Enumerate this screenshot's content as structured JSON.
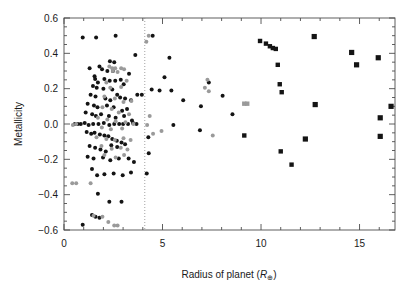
{
  "chart_data": {
    "type": "scatter",
    "title": "",
    "xlabel": "Radius of planet (R⊕)",
    "ylabel": "Metallicity",
    "xlim": [
      0,
      16.8
    ],
    "ylim": [
      -0.6,
      0.6
    ],
    "xticks": [
      0,
      5,
      10,
      15
    ],
    "xtick_labels": [
      "0",
      "5",
      "10",
      "15"
    ],
    "yticks": [
      -0.6,
      -0.4,
      -0.2,
      0.0,
      0.2,
      0.4,
      0.6
    ],
    "ytick_labels": [
      "-0.6",
      "-0.4",
      "-0.2",
      "0.0",
      "0.2",
      "0.4",
      "0.6"
    ],
    "xminor_step": 1,
    "yminor_step": 0.05,
    "grid": false,
    "legend": "none",
    "annotations": [
      {
        "type": "vline",
        "x": 4.1,
        "style": "dotted",
        "color": "#8c8c8c",
        "label": "radius divider at 4 Earth radii"
      }
    ],
    "series": [
      {
        "name": "dark-markers",
        "color": "#141414",
        "marker": "circle",
        "points": [
          [
            0.95,
            0.49
          ],
          [
            1.63,
            0.49
          ],
          [
            2.62,
            0.5
          ],
          [
            2.33,
            0.355
          ],
          [
            2.55,
            0.35
          ],
          [
            1.3,
            0.315
          ],
          [
            1.8,
            0.325
          ],
          [
            1.93,
            0.31
          ],
          [
            2.2,
            0.3
          ],
          [
            2.48,
            0.3
          ],
          [
            3.62,
            0.39
          ],
          [
            4.5,
            0.5
          ],
          [
            1.55,
            0.27
          ],
          [
            1.58,
            0.255
          ],
          [
            1.72,
            0.235
          ],
          [
            2.05,
            0.255
          ],
          [
            2.32,
            0.245
          ],
          [
            2.6,
            0.245
          ],
          [
            2.88,
            0.25
          ],
          [
            3.03,
            0.225
          ],
          [
            3.3,
            0.285
          ],
          [
            1.47,
            0.215
          ],
          [
            1.66,
            0.205
          ],
          [
            2.0,
            0.2
          ],
          [
            2.45,
            0.195
          ],
          [
            2.7,
            0.165
          ],
          [
            1.35,
            0.165
          ],
          [
            1.6,
            0.155
          ],
          [
            2.1,
            0.145
          ],
          [
            2.35,
            0.135
          ],
          [
            2.85,
            0.15
          ],
          [
            3.1,
            0.145
          ],
          [
            3.4,
            0.135
          ],
          [
            3.72,
            0.165
          ],
          [
            3.95,
            0.165
          ],
          [
            1.2,
            0.115
          ],
          [
            1.52,
            0.105
          ],
          [
            1.7,
            0.095
          ],
          [
            2.18,
            0.105
          ],
          [
            2.52,
            0.095
          ],
          [
            2.95,
            0.075
          ],
          [
            3.2,
            0.085
          ],
          [
            1.1,
            0.065
          ],
          [
            1.43,
            0.055
          ],
          [
            1.62,
            0.045
          ],
          [
            1.88,
            0.055
          ],
          [
            2.28,
            0.045
          ],
          [
            2.62,
            0.035
          ],
          [
            3.05,
            0.045
          ],
          [
            3.45,
            0.02
          ],
          [
            0.55,
            0.0
          ],
          [
            0.7,
            0.0
          ],
          [
            0.85,
            0.0
          ],
          [
            1.05,
            0.005
          ],
          [
            1.25,
            -0.005
          ],
          [
            1.48,
            0.0
          ],
          [
            1.75,
            0.0
          ],
          [
            2.02,
            0.005
          ],
          [
            2.3,
            -0.005
          ],
          [
            2.55,
            0.0
          ],
          [
            2.8,
            0.0
          ],
          [
            3.0,
            0.0
          ],
          [
            3.25,
            0.0
          ],
          [
            3.5,
            0.005
          ],
          [
            3.68,
            0.0
          ],
          [
            1.15,
            -0.045
          ],
          [
            1.38,
            -0.055
          ],
          [
            1.55,
            -0.05
          ],
          [
            1.82,
            -0.06
          ],
          [
            2.05,
            -0.065
          ],
          [
            2.25,
            -0.07
          ],
          [
            2.45,
            -0.085
          ],
          [
            2.68,
            -0.095
          ],
          [
            2.92,
            -0.105
          ],
          [
            1.3,
            -0.125
          ],
          [
            1.58,
            -0.135
          ],
          [
            1.85,
            -0.145
          ],
          [
            2.12,
            -0.155
          ],
          [
            2.4,
            -0.12
          ],
          [
            2.7,
            -0.13
          ],
          [
            3.1,
            -0.115
          ],
          [
            1.2,
            -0.185
          ],
          [
            1.5,
            -0.195
          ],
          [
            1.98,
            -0.19
          ],
          [
            2.35,
            -0.205
          ],
          [
            2.78,
            -0.195
          ],
          [
            3.28,
            -0.195
          ],
          [
            3.55,
            -0.215
          ],
          [
            1.42,
            -0.255
          ],
          [
            1.68,
            -0.29
          ],
          [
            2.05,
            -0.285
          ],
          [
            2.52,
            -0.28
          ],
          [
            2.98,
            -0.29
          ],
          [
            3.4,
            -0.275
          ],
          [
            1.72,
            -0.395
          ],
          [
            2.3,
            -0.44
          ],
          [
            2.92,
            -0.44
          ],
          [
            1.42,
            -0.515
          ],
          [
            1.6,
            -0.525
          ],
          [
            1.8,
            -0.53
          ],
          [
            0.95,
            -0.57
          ],
          [
            4.2,
            -0.28
          ],
          [
            4.3,
            -0.165
          ],
          [
            4.28,
            -0.075
          ],
          [
            4.45,
            0.195
          ],
          [
            4.85,
            0.19
          ],
          [
            5.1,
            0.265
          ],
          [
            5.35,
            0.375
          ],
          [
            5.45,
            0.19
          ],
          [
            5.55,
            -0.005
          ],
          [
            6.05,
            0.135
          ],
          [
            6.95,
            0.1
          ],
          [
            6.9,
            -0.035
          ],
          [
            7.35,
            0.235
          ],
          [
            8.05,
            0.16
          ],
          [
            8.55,
            0.055
          ],
          [
            9.15,
            -0.065
          ],
          [
            9.95,
            0.47
          ],
          [
            10.25,
            0.455
          ],
          [
            10.45,
            0.44
          ],
          [
            10.6,
            0.43
          ],
          [
            10.75,
            0.425
          ],
          [
            10.85,
            0.335
          ],
          [
            10.95,
            0.225
          ],
          [
            11.05,
            0.18
          ],
          [
            11.0,
            -0.155
          ],
          [
            11.55,
            -0.23
          ],
          [
            12.25,
            -0.085
          ],
          [
            12.7,
            0.495
          ],
          [
            12.75,
            0.11
          ],
          [
            14.6,
            0.405
          ],
          [
            14.85,
            0.335
          ],
          [
            15.95,
            0.375
          ],
          [
            16.05,
            0.035
          ],
          [
            16.05,
            -0.07
          ],
          [
            16.6,
            0.1
          ]
        ]
      },
      {
        "name": "gray-markers",
        "color": "#9a9a9a",
        "marker": "circle",
        "points": [
          [
            2.3,
            0.325
          ],
          [
            2.45,
            0.315
          ],
          [
            2.6,
            0.315
          ],
          [
            2.9,
            0.315
          ],
          [
            3.05,
            0.31
          ],
          [
            2.48,
            0.3
          ],
          [
            2.72,
            0.295
          ],
          [
            4.18,
            0.465
          ],
          [
            4.3,
            0.5
          ],
          [
            2.15,
            0.235
          ],
          [
            3.18,
            0.245
          ],
          [
            2.35,
            0.205
          ],
          [
            2.9,
            0.21
          ],
          [
            2.05,
            0.155
          ],
          [
            2.58,
            0.145
          ],
          [
            3.02,
            0.125
          ],
          [
            3.42,
            0.13
          ],
          [
            1.95,
            0.095
          ],
          [
            2.42,
            0.085
          ],
          [
            2.78,
            0.065
          ],
          [
            3.3,
            0.055
          ],
          [
            1.72,
            0.035
          ],
          [
            2.2,
            0.025
          ],
          [
            2.62,
            0.015
          ],
          [
            3.12,
            0.01
          ],
          [
            3.52,
            0.0
          ],
          [
            0.45,
            -0.005
          ],
          [
            0.62,
            0.0
          ],
          [
            1.92,
            -0.02
          ],
          [
            2.38,
            -0.03
          ],
          [
            2.95,
            -0.025
          ],
          [
            1.65,
            -0.075
          ],
          [
            2.15,
            -0.085
          ],
          [
            2.58,
            -0.09
          ],
          [
            3.02,
            -0.08
          ],
          [
            3.38,
            -0.09
          ],
          [
            1.9,
            -0.125
          ],
          [
            2.42,
            -0.14
          ],
          [
            2.88,
            -0.135
          ],
          [
            3.22,
            -0.145
          ],
          [
            2.05,
            -0.175
          ],
          [
            2.62,
            -0.19
          ],
          [
            3.05,
            -0.175
          ],
          [
            0.42,
            -0.335
          ],
          [
            0.62,
            -0.335
          ],
          [
            1.35,
            -0.335
          ],
          [
            1.5,
            -0.52
          ],
          [
            1.95,
            -0.525
          ],
          [
            2.25,
            -0.555
          ],
          [
            2.55,
            -0.575
          ],
          [
            2.72,
            -0.575
          ],
          [
            4.22,
            -0.005
          ],
          [
            4.35,
            0.045
          ],
          [
            4.52,
            -0.055
          ],
          [
            4.95,
            -0.04
          ],
          [
            7.15,
            0.205
          ],
          [
            7.28,
            0.25
          ],
          [
            7.35,
            0.185
          ],
          [
            7.55,
            -0.065
          ],
          [
            9.15,
            0.115
          ],
          [
            9.3,
            0.115
          ]
        ]
      }
    ]
  },
  "axes": {
    "xlabel": "Radius of planet (R⊕)",
    "ylabel": "Metallicity",
    "xtick_labels": [
      "0",
      "5",
      "10",
      "15"
    ],
    "ytick_labels": [
      "0.6",
      "0.4",
      "0.2",
      "0.0",
      "−0.2",
      "−0.4",
      "−0.6"
    ]
  },
  "colors": {
    "frame": "#4d4d4d",
    "text": "#1a1a1a",
    "dark_marker": "#141414",
    "gray_marker": "#9a9a9a",
    "divider": "#8c8c8c",
    "background": "#ffffff"
  }
}
